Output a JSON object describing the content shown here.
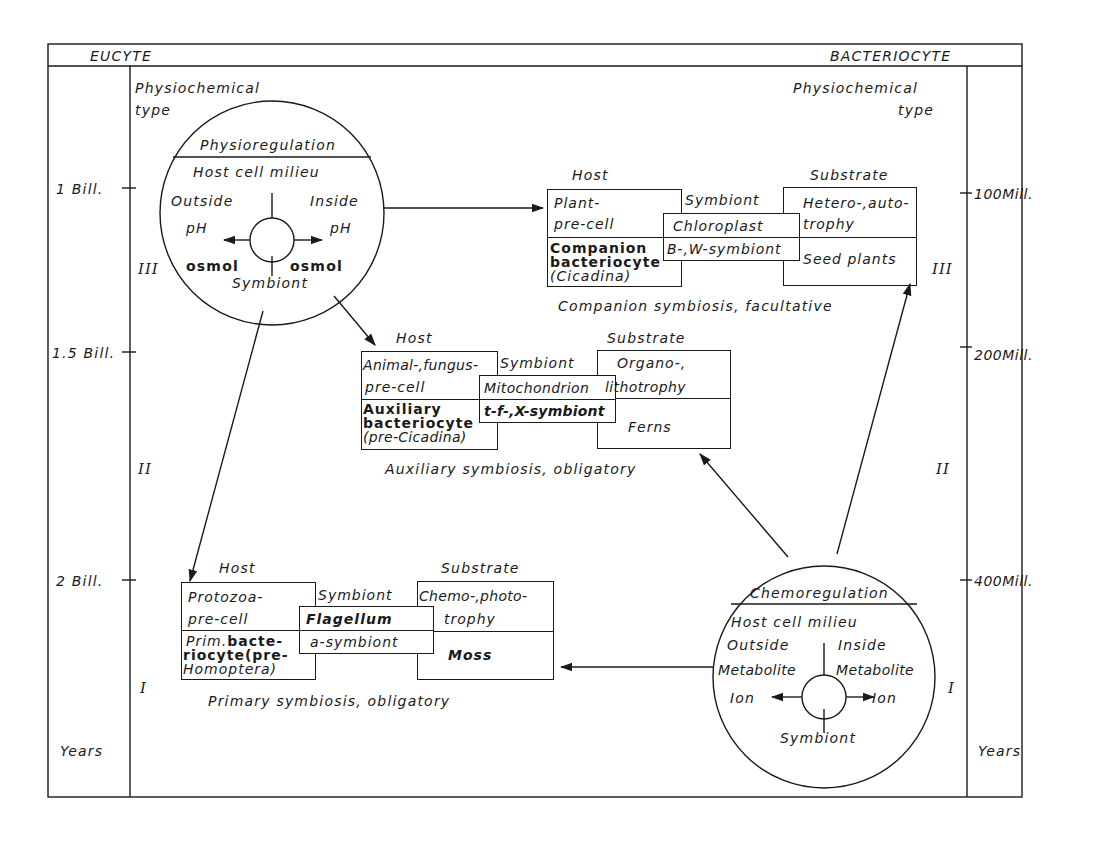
{
  "frame": {
    "left_header": "EUCYTE",
    "right_header": "BACTERIOCYTE"
  },
  "left_axis": {
    "ticks": [
      "1 Bill.",
      "1.5 Bill.",
      "2 Bill."
    ],
    "unit": "Years",
    "phases": [
      "III",
      "II",
      "I"
    ],
    "physiochemical_type": [
      "Physiochemical",
      "type"
    ]
  },
  "right_axis": {
    "ticks": [
      "100Mill.",
      "200Mill.",
      "400Mill."
    ],
    "unit": "Years",
    "phases": [
      "III",
      "II",
      "I"
    ],
    "physiochemical_type": [
      "Physiochemical",
      "type"
    ]
  },
  "physioregulation": {
    "title": "Physioregulation",
    "milieu": "Host cell milieu",
    "outside": "Outside",
    "inside": "Inside",
    "left_1": "pH",
    "right_1": "pH",
    "left_2": "osmol",
    "right_2": "osmol",
    "symbiont": "Symbiont"
  },
  "chemoregulation": {
    "title": "Chemoregulation",
    "milieu": "Host cell milieu",
    "outside": "Outside",
    "inside": "Inside",
    "left_1": "Metabolite",
    "right_1": "Metabolite",
    "left_2": "Ion",
    "right_2": "Ion",
    "symbiont": "Symbiont"
  },
  "companion": {
    "host_label": "Host",
    "symbiont_label": "Symbiont",
    "substrate_label": "Substrate",
    "host_top": [
      "Plant-",
      "pre-cell"
    ],
    "host_bottom": [
      "Companion",
      "bacteriocyte",
      "(Cicadina)"
    ],
    "symbiont_top": "Chloroplast",
    "symbiont_bottom": "B-,W-symbiont",
    "substrate_top": [
      "Hetero-,auto-",
      "trophy"
    ],
    "substrate_bottom": "Seed plants",
    "caption": "Companion  symbiosis, facultative"
  },
  "auxiliary": {
    "host_label": "Host",
    "symbiont_label": "Symbiont",
    "substrate_label": "Substrate",
    "host_top": [
      "Animal-,fungus-",
      "pre-cell"
    ],
    "host_bottom": [
      "Auxiliary",
      "bacteriocyte",
      "(pre-Cicadina)"
    ],
    "symbiont_top": "Mitochondrion",
    "symbiont_bottom": "t-f-,X-symbiont",
    "substrate_top": [
      "Organo-,",
      "lithotrophy"
    ],
    "substrate_bottom": "Ferns",
    "caption": "Auxiliary  symbiosis, obligatory"
  },
  "primary": {
    "host_label": "Host",
    "symbiont_label": "Symbiont",
    "substrate_label": "Substrate",
    "host_top": [
      "Protozoa-",
      "pre-cell"
    ],
    "host_bottom_prefix": "Prim.",
    "host_bottom": [
      "bacte-",
      "riocyte(pre-",
      "Homoptera)"
    ],
    "symbiont_top": "Flagellum",
    "symbiont_bottom": "a-symbiont",
    "substrate_top": [
      "Chemo-,photo-",
      "trophy"
    ],
    "substrate_bottom": "Moss",
    "caption": "Primary  symbiosis, obligatory"
  }
}
